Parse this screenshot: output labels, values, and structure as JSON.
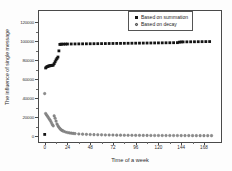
{
  "chart_data": {
    "type": "scatter",
    "title": "",
    "xlabel": "Time of a week",
    "ylabel": "The influence of single message",
    "xlim": [
      -6,
      186
    ],
    "ylim": [
      -6000,
      132000
    ],
    "xticks": [
      0,
      24,
      48,
      72,
      96,
      120,
      144,
      168
    ],
    "xticklabels": [
      "0",
      "24",
      "48",
      "72",
      "96",
      "120",
      "144",
      "168"
    ],
    "yticks": [
      0,
      20000,
      40000,
      60000,
      80000,
      100000,
      120000
    ],
    "yticklabels": [
      "0",
      "20000",
      "40000",
      "60000",
      "80000",
      "100000",
      "120000"
    ],
    "grid": false,
    "legend_position": "upper right",
    "series": [
      {
        "name": "Based on summation",
        "marker": "square",
        "color": "#141414",
        "x": [
          0,
          1,
          2,
          3,
          4,
          5,
          6,
          7,
          8,
          9,
          10,
          11,
          12,
          13,
          14,
          15,
          16,
          17,
          18,
          20,
          22,
          24,
          28,
          32,
          36,
          40,
          44,
          48,
          52,
          56,
          60,
          64,
          68,
          72,
          76,
          80,
          84,
          88,
          92,
          96,
          100,
          104,
          108,
          112,
          116,
          120,
          124,
          128,
          132,
          136,
          140,
          142,
          144,
          146,
          150,
          154,
          158,
          162,
          166,
          170,
          174
        ],
        "y": [
          2000,
          72000,
          73000,
          73500,
          74000,
          74200,
          74400,
          74600,
          74800,
          75000,
          76500,
          78500,
          80500,
          82000,
          83500,
          90000,
          96800,
          97000,
          97050,
          97100,
          97150,
          97200,
          97250,
          97300,
          97350,
          97400,
          97450,
          97500,
          97550,
          97600,
          97650,
          97700,
          97750,
          97800,
          97850,
          97900,
          97950,
          98000,
          98050,
          98100,
          98150,
          98200,
          98250,
          98300,
          98350,
          98400,
          98450,
          98500,
          98550,
          98600,
          98650,
          99200,
          99400,
          99450,
          99500,
          99550,
          99600,
          99650,
          99700,
          99750,
          99800
        ]
      },
      {
        "name": "Based on decay",
        "marker": "circle",
        "color": "#8c8c8c",
        "x": [
          0,
          1,
          2,
          3,
          4,
          5,
          6,
          7,
          8,
          9,
          10,
          11,
          12,
          13,
          14,
          15,
          16,
          17,
          18,
          19,
          20,
          22,
          24,
          26,
          28,
          30,
          32,
          36,
          40,
          44,
          48,
          52,
          56,
          60,
          64,
          68,
          72,
          76,
          80,
          84,
          88,
          92,
          96,
          100,
          104,
          108,
          112,
          116,
          120,
          124,
          128,
          132,
          136,
          140,
          144,
          148,
          152,
          156,
          160,
          164,
          168,
          172,
          176
        ],
        "y": [
          45000,
          24000,
          22500,
          21000,
          19500,
          18000,
          16500,
          14500,
          12500,
          11000,
          21500,
          19000,
          16000,
          13000,
          11000,
          9500,
          8200,
          7200,
          6400,
          5800,
          5300,
          4500,
          4000,
          3600,
          3300,
          3050,
          2850,
          2500,
          2250,
          2050,
          1880,
          1750,
          1630,
          1530,
          1450,
          1370,
          1300,
          1240,
          1190,
          1140,
          1100,
          1060,
          1020,
          990,
          960,
          930,
          905,
          880,
          860,
          840,
          820,
          800,
          785,
          770,
          755,
          740,
          730,
          715,
          705,
          695,
          685,
          675,
          665
        ]
      }
    ],
    "legend": [
      {
        "label": "Based on summation",
        "marker": "square"
      },
      {
        "label": "Based on decay",
        "marker": "circle"
      }
    ]
  }
}
